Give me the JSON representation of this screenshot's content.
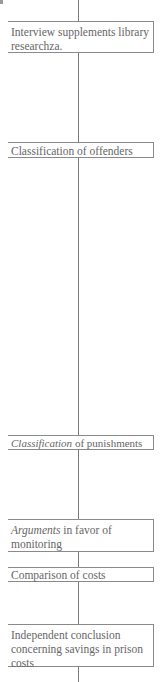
{
  "diagram": {
    "type": "vertical-flow",
    "nodes": [
      {
        "id": "n1",
        "lines": [
          {
            "italic": "",
            "text": "Interview supplements library researchza."
          }
        ]
      },
      {
        "id": "n2",
        "lines": [
          {
            "italic": "",
            "text": "Classification of offenders"
          }
        ]
      },
      {
        "id": "n3",
        "lines": [
          {
            "italic": "Classification",
            "text": " of punishments"
          }
        ]
      },
      {
        "id": "n4",
        "lines": [
          {
            "italic": "Arguments",
            "text": " in favor of monitoring"
          }
        ]
      },
      {
        "id": "n5",
        "lines": [
          {
            "italic": "",
            "text": "Comparison of costs"
          }
        ]
      },
      {
        "id": "n6",
        "lines": [
          {
            "italic": "",
            "text": "Independent conclusion concerning savings in prison costs"
          }
        ]
      }
    ],
    "edges": [
      [
        "top",
        "n1"
      ],
      [
        "n1",
        "n2"
      ],
      [
        "n2",
        "n3"
      ],
      [
        "n3",
        "n4"
      ],
      [
        "n4",
        "n5"
      ],
      [
        "n5",
        "n6"
      ],
      [
        "n6",
        "bottom"
      ]
    ],
    "colors": {
      "line": "#7a7a7a",
      "border": "#8a8a8a",
      "text": "#666666",
      "background": "#ffffff"
    }
  }
}
